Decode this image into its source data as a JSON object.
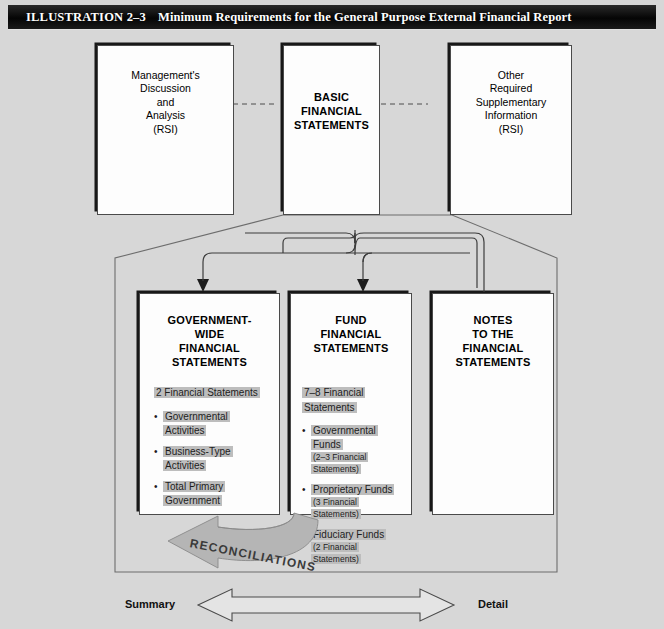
{
  "illustration": {
    "number_label": "ILLUSTRATION 2–3",
    "title": "Minimum Requirements for the General Purpose External Financial Report"
  },
  "top_row": {
    "mdna_box": {
      "name": "mdna",
      "lines": [
        "Management's",
        "Discussion",
        "and",
        "Analysis",
        "(RSI)"
      ],
      "text": "Management's\nDiscussion\nand\nAnalysis\n(RSI)"
    },
    "basic_box": {
      "name": "basic-financial-statements",
      "lines": [
        "BASIC",
        "FINANCIAL",
        "STATEMENTS"
      ],
      "text": "BASIC\nFINANCIAL\nSTATEMENTS"
    },
    "orsi_box": {
      "name": "other-required-supplementary-information",
      "lines": [
        "Other",
        "Required",
        "Supplementary",
        "Information",
        "(RSI)"
      ],
      "text": "Other\nRequired\nSupplementary\nInformation\n(RSI)"
    }
  },
  "bottom_row": {
    "gov_wide": {
      "heading": "GOVERNMENT-\nWIDE\nFINANCIAL\nSTATEMENTS",
      "statement_count": "2 Financial Statements",
      "bullets": [
        {
          "label": "Governmental Activities",
          "sub": ""
        },
        {
          "label": "Business-Type Activities",
          "sub": ""
        },
        {
          "label": "Total Primary Government",
          "sub": ""
        }
      ]
    },
    "fund": {
      "heading": "FUND\nFINANCIAL\nSTATEMENTS",
      "statement_count": "7–8 Financial Statements",
      "bullets": [
        {
          "label": "Governmental Funds",
          "sub": "(2–3 Financial Statements)"
        },
        {
          "label": "Proprietary Funds",
          "sub": "(3 Financial Statements)"
        },
        {
          "label": "Fiduciary Funds",
          "sub": "(2 Financial Statements)"
        }
      ]
    },
    "notes": {
      "heading": "NOTES\nTO THE\nFINANCIAL\nSTATEMENTS"
    }
  },
  "reconciliations": {
    "label": "RECONCILIATIONS"
  },
  "scale": {
    "left_label": "Summary",
    "right_label": "Detail"
  },
  "colors": {
    "page_background": "#d7d7d7",
    "title_bar": "#0a0a0a",
    "title_text": "#ffffff",
    "box_fill": "#fdfdfd",
    "box_border": "#4a4a4a",
    "box_shadow": "#181818",
    "highlight": "#bdbdbd",
    "arrow_fill": "#b5b5b5",
    "line": "#555555"
  }
}
